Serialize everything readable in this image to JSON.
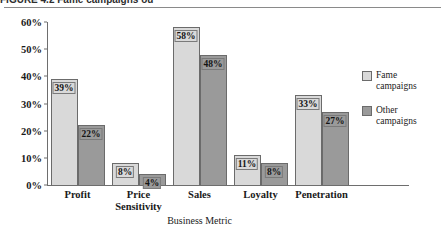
{
  "figure": {
    "caption_fragment": "FIGURE 4.2   Fame campaigns ou"
  },
  "chart_data": {
    "type": "bar",
    "title": "",
    "xlabel": "Business Metric",
    "ylabel": "",
    "ylim": [
      0,
      60
    ],
    "ytick_labels": [
      "0%",
      "10%",
      "20%",
      "30%",
      "40%",
      "50%",
      "60%"
    ],
    "ytick_values": [
      0,
      10,
      20,
      30,
      40,
      50,
      60
    ],
    "grid": false,
    "legend_position": "right",
    "categories": [
      "Profit",
      "Price Sensitivity",
      "Sales",
      "Loyalty",
      "Penetration"
    ],
    "category_lines": [
      [
        "Profit"
      ],
      [
        "Price",
        "Sensitivity"
      ],
      [
        "Sales"
      ],
      [
        "Loyalty"
      ],
      [
        "Penetration"
      ]
    ],
    "series": [
      {
        "name": "Fame campaigns",
        "name_lines": [
          "Fame",
          "campaigns"
        ],
        "color": "#d9d9d9",
        "values": [
          39,
          8,
          58,
          11,
          33
        ],
        "labels": [
          "39%",
          "8%",
          "58%",
          "11%",
          "33%"
        ]
      },
      {
        "name": "Other campaigns",
        "name_lines": [
          "Other",
          "campaigns"
        ],
        "color": "#9a9a9a",
        "values": [
          22,
          4,
          48,
          8,
          27
        ],
        "labels": [
          "22%",
          "4%",
          "48%",
          "8%",
          "27%"
        ]
      }
    ]
  }
}
